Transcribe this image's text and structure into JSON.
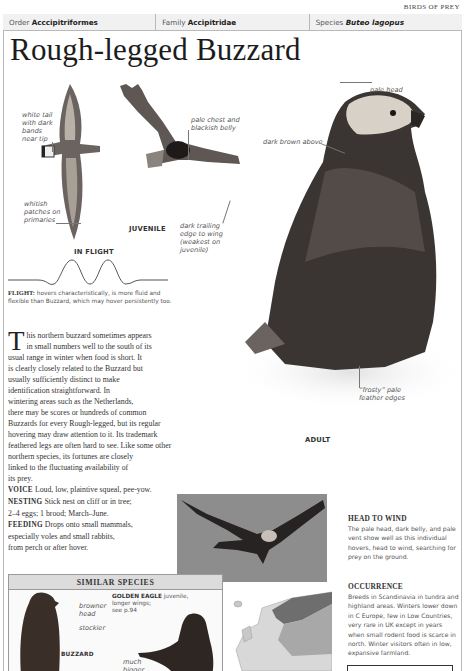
{
  "header": {
    "section_tag": "BIRDS OF PREY",
    "taxonomy": [
      {
        "label": "Order",
        "value": "Acccipitriformes"
      },
      {
        "label": "Family",
        "value": "Accipitridae"
      },
      {
        "label": "Species",
        "value": "Buteo lagopus"
      }
    ]
  },
  "title": "Rough-legged Buzzard",
  "flight_illustration": {
    "labels": {
      "white_tail": [
        "white tail",
        "with dark",
        "bands",
        "near tip"
      ],
      "whitish_patches": [
        "whitish",
        "patches on",
        "primaries"
      ],
      "pale_chest": [
        "pale chest and",
        "blackish belly"
      ],
      "dark_trailing": [
        "dark trailing",
        "edge to wing",
        "(weakest on",
        "juvenile)"
      ]
    },
    "captions": {
      "in_flight": "IN FLIGHT",
      "juvenile": "JUVENILE"
    }
  },
  "adult_illustration": {
    "labels": {
      "pale_head": "pale head",
      "dark_brown": "dark brown above",
      "frosty": [
        "“frosty” pale",
        "feather edges"
      ]
    },
    "caption": "ADULT"
  },
  "flight_note": {
    "heading": "FLIGHT:",
    "text": "hovers characteristically, is more fluid and flexible than Buzzard, which may hover persistently too."
  },
  "intro": {
    "dropcap": "T",
    "lines": [
      "his northern buzzard sometimes appears",
      "in small numbers well to the south of its",
      "usual range in winter when food is short. It",
      "is clearly closely related to the Buzzard but",
      "usually sufficiently distinct to make",
      "identification straightforward. In",
      "wintering areas such as the Netherlands,",
      "there may be scores or hundreds of common",
      "Buzzards for every Rough-legged, but its regular",
      "hovering may draw attention to it. Its trademark",
      "feathered legs are often hard to see. Like some other",
      "northern species, its fortunes are closely",
      "linked to the fluctuating availability of",
      "its prey."
    ],
    "facts": [
      {
        "key": "VOICE",
        "lines": [
          "Loud, low, plaintive squeal, pee-yow."
        ]
      },
      {
        "key": "NESTING",
        "lines": [
          "Stick nest on cliff or in tree;",
          "2–4 eggs; 1 brood; March–June."
        ]
      },
      {
        "key": "FEEDING",
        "lines": [
          "Drops onto small mammals,",
          "especially voles and small rabbits,",
          "from perch or after hover."
        ]
      }
    ]
  },
  "sidebar": {
    "head_to_wind": {
      "heading": "HEAD TO WIND",
      "body": "The pale head, dark belly, and pale vent show well as this individual hovers, head to wind, searching for prey on the ground."
    },
    "occurrence": {
      "heading": "OCCURRENCE",
      "body": "Breeds in Scandinavia in tundra and highland areas. Winters lower down in C Europe, few in Low Countries, very rare in UK except in years when small rodent food is scarce in north. Winter visitors often in low, expansive farmland."
    }
  },
  "similar_species": {
    "heading": "SIMILAR SPECIES",
    "buzzard": {
      "name": "BUZZARD",
      "labels": [
        [
          "browner",
          "head"
        ],
        [
          "stockier"
        ]
      ]
    },
    "golden_eagle": {
      "name": "GOLDEN EAGLE",
      "note": [
        "juvenile,",
        "longer wings;",
        "see p.94"
      ],
      "labels": [
        [
          "much",
          "bigger"
        ]
      ]
    }
  },
  "colors": {
    "border": "#b9b9b9",
    "bar_bg": "#f1f1f1",
    "similar_head_bg": "#dcdcdc",
    "photo_bg": "#8d8d8d",
    "map_breeding": "#6e6e6e",
    "map_winter": "#a8a8a8",
    "map_land": "#d8d8d8"
  }
}
